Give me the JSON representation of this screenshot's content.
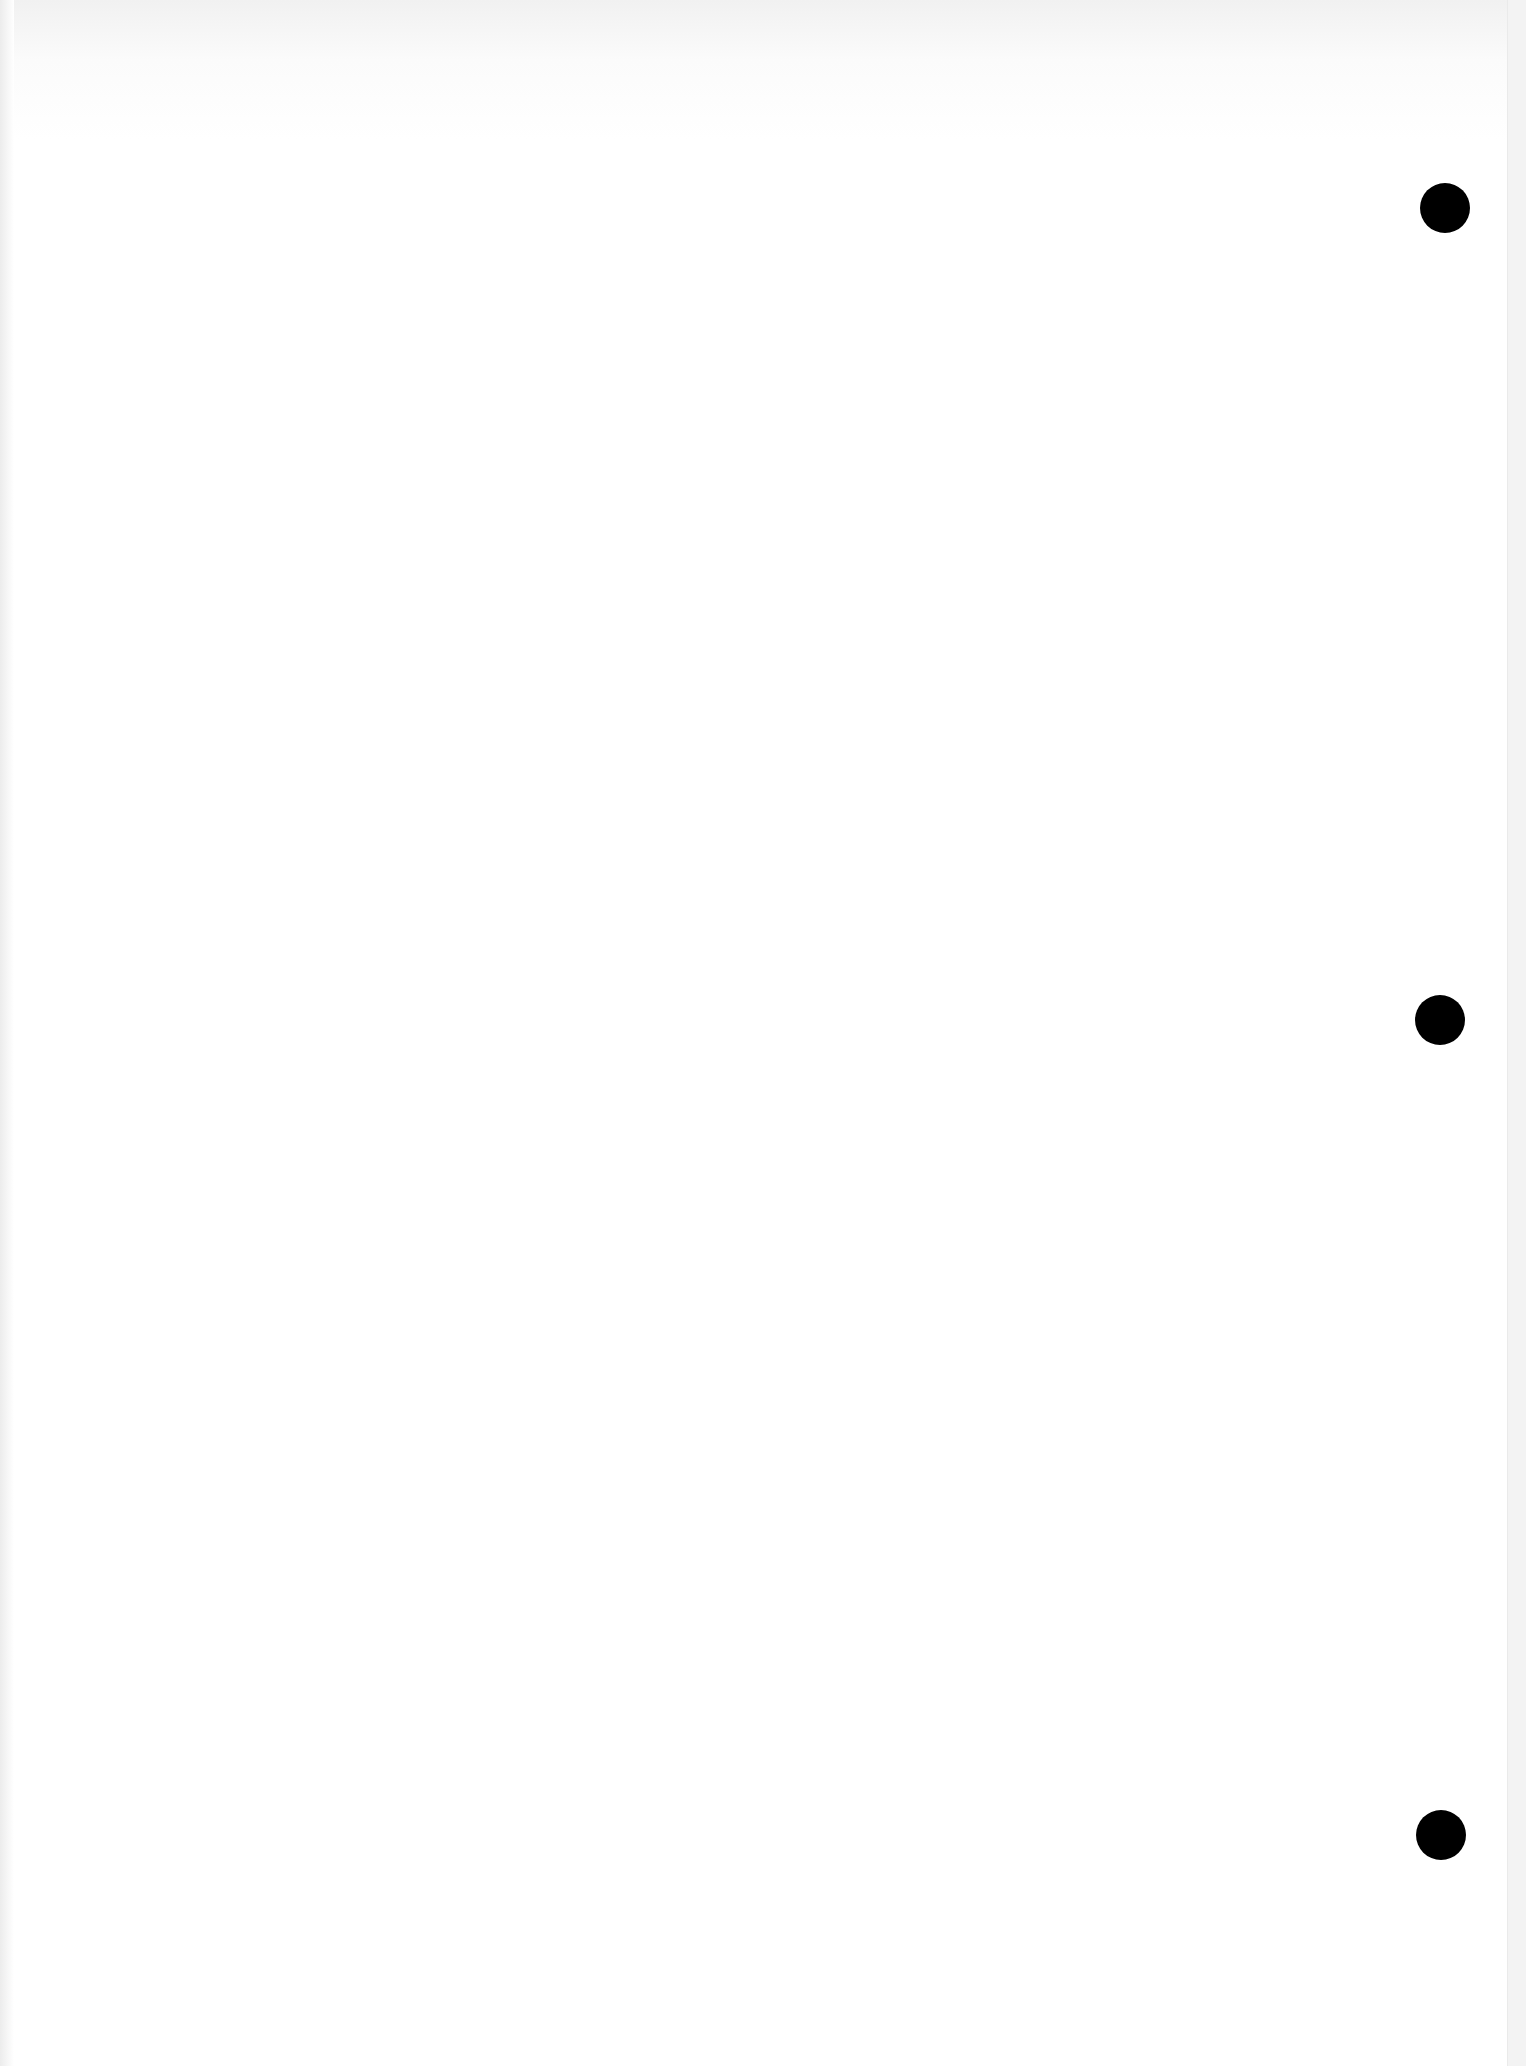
{
  "document": {
    "type": "scanned blank page",
    "bleed_through_text": [
      "",
      "",
      "",
      "",
      "",
      ""
    ],
    "punch_holes": [
      {
        "x": 1445,
        "y": 208
      },
      {
        "x": 1440,
        "y": 1020
      },
      {
        "x": 1441,
        "y": 1835
      }
    ],
    "colors": {
      "paper": "#ffffff",
      "hole": "#000000"
    }
  }
}
